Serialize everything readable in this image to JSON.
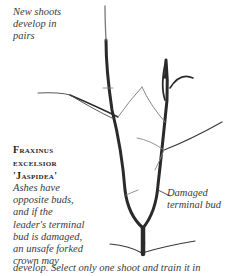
{
  "annotations": {
    "new_shoots": [
      "New shoots",
      "develop in",
      "pairs"
    ],
    "damaged_bud": [
      "Damaged",
      "terminal bud"
    ]
  },
  "plant": {
    "name_lines": [
      "Fraxinus",
      "excelsior",
      "'Jaspidea'"
    ]
  },
  "description": {
    "lines": [
      "Ashes have",
      "opposite buds,",
      "and if the",
      "leader's terminal",
      "bud is damaged,",
      "an unsafe forked",
      "crown may"
    ],
    "last_line": "develop. Select only one shoot and train it in"
  },
  "colors": {
    "branch": "#2a2a2a",
    "twig": "#6a6a6a",
    "text": "#3a3a3a"
  }
}
